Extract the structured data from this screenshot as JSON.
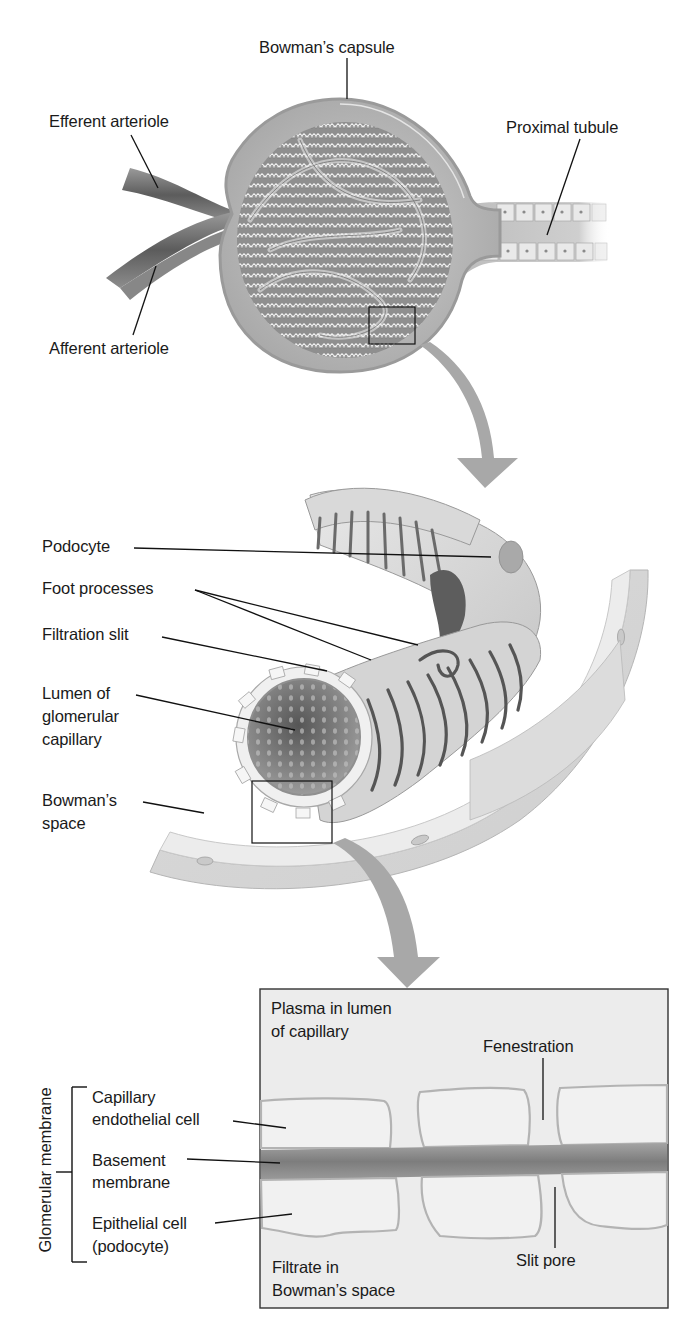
{
  "figure": {
    "colors": {
      "background": "#ffffff",
      "text": "#1a1a1a",
      "leader_line": "#111111",
      "tissue_light": "#e6e6e6",
      "tissue_mid": "#bdbdbd",
      "tissue_dark": "#6e6e6e",
      "arrow": "#a8a8a8",
      "membrane_band": "#8a8a8a",
      "inset_bg": "#ececec"
    }
  },
  "panel_top": {
    "name": "Renal corpuscle",
    "labels": {
      "bowmans_capsule": "Bowman’s capsule",
      "efferent_arteriole": "Efferent arteriole",
      "proximal_tubule": "Proximal tubule",
      "afferent_arteriole": "Afferent arteriole"
    }
  },
  "panel_middle": {
    "name": "Podocyte on glomerular capillary",
    "labels": {
      "podocyte": "Podocyte",
      "foot_processes": "Foot processes",
      "filtration_slit": "Filtration slit",
      "lumen_line1": "Lumen of",
      "lumen_line2": "glomerular",
      "lumen_line3": "capillary",
      "bowmans_space_line1": "Bowman’s",
      "bowmans_space_line2": "space"
    }
  },
  "panel_bottom": {
    "name": "Glomerular membrane cross-section",
    "group_label": "Glomerular membrane",
    "labels": {
      "plasma_line1": "Plasma in lumen",
      "plasma_line2": "of capillary",
      "fenestration": "Fenestration",
      "capillary_line1": "Capillary",
      "capillary_line2": "endothelial cell",
      "basement_line1": "Basement",
      "basement_line2": "membrane",
      "epithelial_line1": "Epithelial cell",
      "epithelial_line2": "(podocyte)",
      "filtrate_line1": "Filtrate in",
      "filtrate_line2": "Bowman’s space",
      "slit_pore": "Slit pore"
    }
  }
}
